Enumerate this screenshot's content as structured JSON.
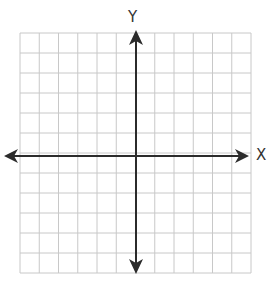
{
  "diagram": {
    "type": "coordinate-plane",
    "x_axis_label": "X",
    "y_axis_label": "Y",
    "grid": {
      "columns": 12,
      "rows": 12,
      "left": 20,
      "top": 33,
      "right": 251,
      "bottom": 273,
      "line_color": "#c8c8c8"
    },
    "axes": {
      "origin_x": 136,
      "origin_y": 156,
      "color": "#2b2b2b",
      "x_axis_arrows": [
        "left",
        "right"
      ],
      "y_axis_arrows": [
        "up",
        "down"
      ]
    }
  }
}
